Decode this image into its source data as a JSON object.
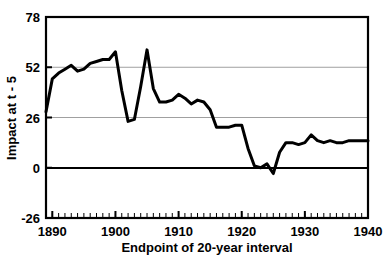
{
  "chart_data": {
    "type": "line",
    "title": "",
    "xlabel": "Endpoint of 20-year interval",
    "ylabel": "Impact at t - 5",
    "xlim": [
      1889,
      1940
    ],
    "ylim": [
      -26,
      78
    ],
    "xticks": [
      1890,
      1900,
      1910,
      1920,
      1930,
      1940
    ],
    "xtick_labels": [
      "1890",
      "1900",
      "1910",
      "1920",
      "1930",
      "1940"
    ],
    "yticks": [
      -26,
      0,
      26,
      52,
      78
    ],
    "ytick_labels": [
      "-26",
      "0",
      "26",
      "52",
      "78"
    ],
    "x_minor_tick_step": 1,
    "grid": "horizontal-only",
    "gridlines_at": [
      26,
      52
    ],
    "zero_line": 0,
    "legend": null,
    "line_color": "#000000",
    "line_width": 3,
    "series": [
      {
        "name": "Impact at t - 5",
        "x": [
          1889,
          1890,
          1891,
          1892,
          1893,
          1894,
          1895,
          1896,
          1897,
          1898,
          1899,
          1900,
          1901,
          1902,
          1903,
          1904,
          1905,
          1906,
          1907,
          1908,
          1909,
          1910,
          1911,
          1912,
          1913,
          1914,
          1915,
          1916,
          1917,
          1918,
          1919,
          1920,
          1921,
          1922,
          1923,
          1924,
          1925,
          1926,
          1927,
          1928,
          1929,
          1930,
          1931,
          1932,
          1933,
          1934,
          1935,
          1936,
          1937,
          1938,
          1939,
          1940
        ],
        "values": [
          29,
          46,
          49,
          51,
          53,
          50,
          51,
          54,
          55,
          56,
          56,
          60,
          40,
          24,
          25,
          42,
          61,
          41,
          34,
          34,
          35,
          38,
          36,
          33,
          35,
          34,
          30,
          21,
          21,
          21,
          22,
          22,
          10,
          1,
          0,
          2,
          -3,
          8,
          13,
          13,
          12,
          13,
          17,
          14,
          13,
          14,
          13,
          13,
          14,
          14,
          14,
          14
        ]
      }
    ]
  },
  "axes": {
    "y_title": "Impact at t - 5",
    "x_title": "Endpoint of 20-year interval"
  }
}
